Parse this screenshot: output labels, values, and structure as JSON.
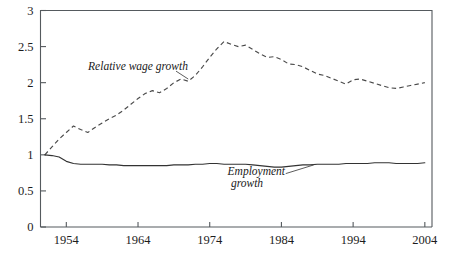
{
  "chart_data": {
    "type": "line",
    "title": "",
    "subtitle": "",
    "xlabel": "",
    "ylabel": "",
    "xlim": [
      1950.4,
      2005.0
    ],
    "ylim": [
      0,
      3
    ],
    "grid": false,
    "legend_position": "inline-annotation",
    "yticks": [
      "0",
      "0.5",
      "1",
      "1.5",
      "2",
      "2.5",
      "3"
    ],
    "ytick_values": [
      0,
      0.5,
      1,
      1.5,
      2,
      2.5,
      3
    ],
    "xticks": [
      "1954",
      "1964",
      "1974",
      "1984",
      "1994",
      "2004"
    ],
    "xtick_values": [
      1954,
      1964,
      1974,
      1984,
      1994,
      2004
    ],
    "annotations": [
      {
        "text": "Relative wage growth",
        "x": 1964.0,
        "y": 2.18
      },
      {
        "text": "Employment",
        "x": 1980.5,
        "y": 0.72
      },
      {
        "text": "growth",
        "x": 1979.2,
        "y": 0.56
      }
    ],
    "series": [
      {
        "name": "Relative wage growth",
        "style": "dashed",
        "color": "#4a4a4a",
        "x": [
          1951,
          1952,
          1953,
          1954,
          1955,
          1956,
          1957,
          1958,
          1959,
          1960,
          1961,
          1962,
          1963,
          1964,
          1965,
          1966,
          1967,
          1968,
          1969,
          1970,
          1971,
          1972,
          1973,
          1974,
          1975,
          1976,
          1977,
          1978,
          1979,
          1980,
          1981,
          1982,
          1983,
          1984,
          1985,
          1986,
          1987,
          1988,
          1989,
          1990,
          1991,
          1992,
          1993,
          1994,
          1995,
          1996,
          1997,
          1998,
          1999,
          2000,
          2001,
          2002,
          2003,
          2004
        ],
        "values": [
          1.0,
          1.11,
          1.22,
          1.31,
          1.4,
          1.35,
          1.31,
          1.38,
          1.44,
          1.5,
          1.55,
          1.62,
          1.7,
          1.78,
          1.85,
          1.89,
          1.86,
          1.92,
          2.0,
          2.05,
          2.02,
          2.1,
          2.22,
          2.35,
          2.47,
          2.57,
          2.53,
          2.5,
          2.52,
          2.46,
          2.4,
          2.35,
          2.36,
          2.32,
          2.26,
          2.25,
          2.22,
          2.17,
          2.12,
          2.1,
          2.06,
          2.02,
          1.98,
          2.04,
          2.05,
          2.02,
          1.99,
          1.96,
          1.93,
          1.92,
          1.94,
          1.96,
          1.98,
          2.0
        ]
      },
      {
        "name": "Employment growth",
        "style": "solid",
        "color": "#333333",
        "x": [
          1951,
          1952,
          1953,
          1954,
          1955,
          1956,
          1957,
          1958,
          1959,
          1960,
          1961,
          1962,
          1963,
          1964,
          1965,
          1966,
          1967,
          1968,
          1969,
          1970,
          1971,
          1972,
          1973,
          1974,
          1975,
          1976,
          1977,
          1978,
          1979,
          1980,
          1981,
          1982,
          1983,
          1984,
          1985,
          1986,
          1987,
          1988,
          1989,
          1990,
          1991,
          1992,
          1993,
          1994,
          1995,
          1996,
          1997,
          1998,
          1999,
          2000,
          2001,
          2002,
          2003,
          2004
        ],
        "values": [
          1.0,
          0.99,
          0.97,
          0.91,
          0.88,
          0.87,
          0.87,
          0.87,
          0.87,
          0.86,
          0.86,
          0.85,
          0.85,
          0.85,
          0.85,
          0.85,
          0.85,
          0.85,
          0.86,
          0.86,
          0.86,
          0.87,
          0.87,
          0.88,
          0.88,
          0.87,
          0.87,
          0.87,
          0.87,
          0.86,
          0.85,
          0.84,
          0.83,
          0.83,
          0.84,
          0.85,
          0.86,
          0.86,
          0.87,
          0.87,
          0.87,
          0.87,
          0.88,
          0.88,
          0.88,
          0.88,
          0.89,
          0.89,
          0.89,
          0.88,
          0.88,
          0.88,
          0.88,
          0.89
        ]
      }
    ]
  }
}
